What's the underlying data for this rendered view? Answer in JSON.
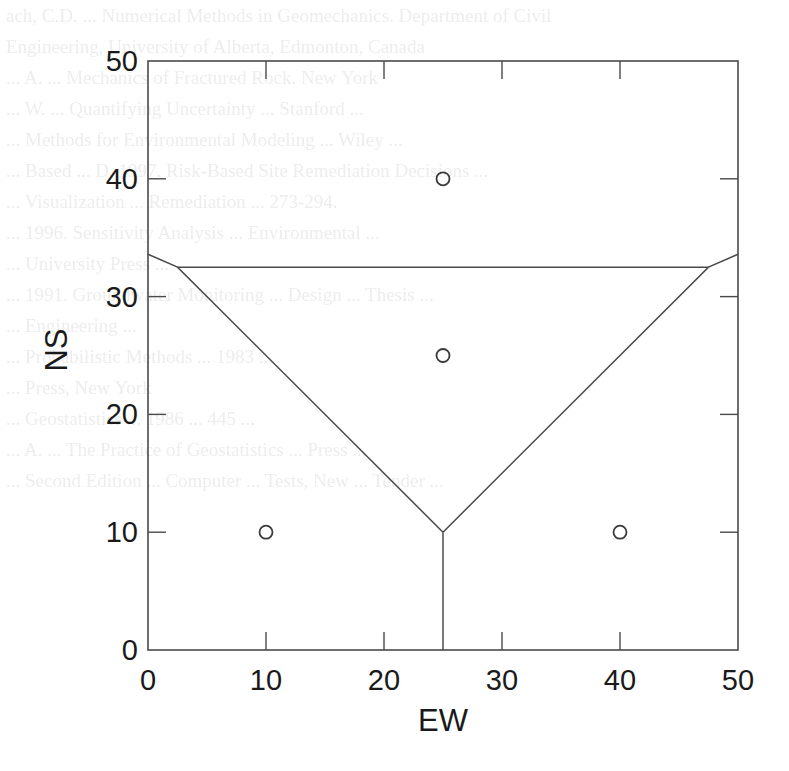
{
  "chart_data": {
    "type": "scatter",
    "title": "",
    "xlabel": "EW",
    "ylabel": "NS",
    "xlim": [
      0,
      50
    ],
    "ylim": [
      0,
      50
    ],
    "grid": false,
    "legend": null,
    "x_ticks": [
      0,
      10,
      20,
      30,
      40,
      50
    ],
    "y_ticks": [
      0,
      10,
      20,
      30,
      40,
      50
    ],
    "x_tick_labels": [
      "0",
      "10",
      "20",
      "30",
      "40",
      "50"
    ],
    "y_tick_labels": [
      "0",
      "10",
      "20",
      "30",
      "40",
      "50"
    ],
    "series": [
      {
        "name": "points",
        "marker": "open-circle",
        "x": [
          25,
          25,
          10,
          40
        ],
        "y": [
          40,
          25,
          10,
          10
        ]
      }
    ],
    "lines": [
      {
        "name": "left-boundary",
        "points": [
          [
            0,
            33.6
          ],
          [
            2.5,
            32.5
          ],
          [
            25,
            10
          ]
        ]
      },
      {
        "name": "right-boundary",
        "points": [
          [
            50,
            33.6
          ],
          [
            47.5,
            32.5
          ],
          [
            25,
            10
          ]
        ]
      },
      {
        "name": "horizontal-boundary",
        "points": [
          [
            2.5,
            32.5
          ],
          [
            47.5,
            32.5
          ]
        ]
      },
      {
        "name": "vertical-boundary",
        "points": [
          [
            25,
            10
          ],
          [
            25,
            0
          ]
        ]
      }
    ]
  },
  "plot": {
    "left": 148,
    "right": 738,
    "top": 61,
    "bottom": 650,
    "stroke": "#4a4a4a",
    "marker_stroke": "#3a3a3a"
  },
  "background_bleed": [
    "ach, C.D. ... Numerical Methods in Geomechanics. Department of Civil",
    "Engineering, University of Alberta, Edmonton, Canada",
    "",
    "... A. ... Mechanics of Fractured Rock. New York",
    "",
    "... W. ... Quantifying Uncertainty ... Stanford ...",
    "... Methods for Environmental Modeling ... Wiley ...",
    "",
    "... Based ... D. 1997. Risk-Based Site Remediation Decisions ...",
    "... Visualization ... Remediation ... 273-294.",
    "",
    "... 1996. Sensitivity Analysis ... Environmental ...",
    "... University Press ...",
    "",
    "... 1991. Groundwater Monitoring ... Design ... Thesis ...",
    "... Engineering ...",
    "",
    "... Probabilistic Methods ... 1983 ...",
    "... Press, New York",
    "",
    "... Geostatistics ... 1986 ... 445 ...",
    "... A. ... The Practice of Geostatistics ... Press ...",
    "... Second Edition ... Computer ... Tests, New ... Tender ..."
  ]
}
